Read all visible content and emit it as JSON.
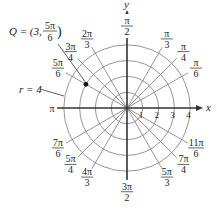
{
  "diagram": {
    "axes": {
      "x_label": "x",
      "y_label": "y"
    },
    "radial_ticks": [
      "1",
      "2",
      "3",
      "4"
    ],
    "circle_radii": [
      1,
      2,
      3,
      4
    ],
    "angle_labels": [
      {
        "deg": 90,
        "num": "π",
        "den": "2"
      },
      {
        "deg": 60,
        "num": "π",
        "den": "3"
      },
      {
        "deg": 45,
        "num": "π",
        "den": "4"
      },
      {
        "deg": 30,
        "num": "π",
        "den": "6"
      },
      {
        "deg": 120,
        "num": "2π",
        "den": "3"
      },
      {
        "deg": 135,
        "num": "3π",
        "den": "4"
      },
      {
        "deg": 150,
        "num": "5π",
        "den": "6"
      },
      {
        "deg": 180,
        "num": "π",
        "den": ""
      },
      {
        "deg": 210,
        "num": "7π",
        "den": "6"
      },
      {
        "deg": 225,
        "num": "5π",
        "den": "4"
      },
      {
        "deg": 240,
        "num": "4π",
        "den": "3"
      },
      {
        "deg": 270,
        "num": "3π",
        "den": "2"
      },
      {
        "deg": 300,
        "num": "5π",
        "den": "3"
      },
      {
        "deg": 315,
        "num": "7π",
        "den": "4"
      },
      {
        "deg": 330,
        "num": "11π",
        "den": "6"
      }
    ],
    "point_q": {
      "label_prefix": "Q = (3,",
      "label_num": "5π",
      "label_den": "6",
      "label_suffix": ")",
      "r": 3,
      "theta_deg": 150
    },
    "circle_annotation": {
      "label": "r = 4",
      "r": 4
    },
    "colors": {
      "grid": "#7a7a7a",
      "axis": "#333333",
      "text": "#222222",
      "point": "#111111"
    }
  }
}
